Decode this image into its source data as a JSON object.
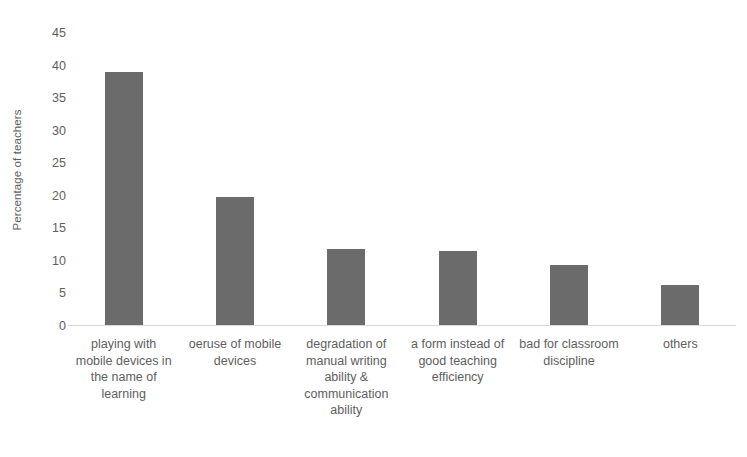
{
  "chart_data": {
    "type": "bar",
    "title": "",
    "subtitle": "",
    "xlabel": "",
    "ylabel": "Percentage of teachers",
    "ylim": [
      0,
      45
    ],
    "ytick_labels": [
      "45",
      "40",
      "35",
      "30",
      "25",
      "20",
      "15",
      "10",
      "5",
      "0"
    ],
    "ytick_values": [
      45,
      40,
      35,
      30,
      25,
      20,
      15,
      10,
      5,
      0
    ],
    "grid": false,
    "legend": false,
    "legend_position": "none",
    "bar_color": "#6b6b6b",
    "axis_color": "#d9d9d9",
    "text_color": "#5e5e5e",
    "categories": [
      "playing with mobile devices in the name of learning",
      "oeruse of mobile devices",
      "degradation of manual writing ability & communication ability",
      "a form instead of good teaching efficiency",
      "bad for classroom discipline",
      "others"
    ],
    "values": [
      38.8,
      19.7,
      11.6,
      11.4,
      9.2,
      6.2
    ],
    "annotations": []
  }
}
